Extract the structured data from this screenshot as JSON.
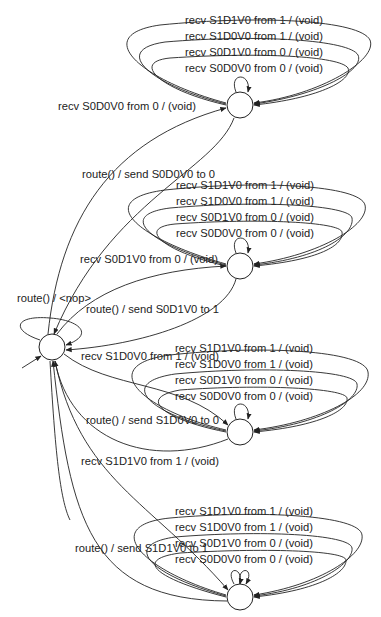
{
  "diagram": {
    "title": "",
    "nodes": [
      {
        "id": "n0",
        "label": "",
        "role": "hub-initial"
      },
      {
        "id": "n1",
        "label": ""
      },
      {
        "id": "n2",
        "label": ""
      },
      {
        "id": "n3",
        "label": ""
      },
      {
        "id": "n4",
        "label": ""
      }
    ],
    "groups": [
      {
        "state": "n1",
        "self_loops": [
          "recv S1D1V0 from 1 / (void)",
          "recv S1D0V0 from 1 / (void)",
          "recv S0D1V0 from 0 / (void)",
          "recv S0D0V0 from 0 / (void)"
        ],
        "to_hub": "route() / send S0D0V0 to 0",
        "from_hub": "recv S0D0V0 from 0 / (void)"
      },
      {
        "state": "n2",
        "self_loops": [
          "recv S1D1V0 from 1 / (void)",
          "recv S1D0V0 from 1 / (void)",
          "recv S0D1V0 from 0 / (void)",
          "recv S0D0V0 from 0 / (void)"
        ],
        "to_hub": "route() / send S0D1V0 to 1",
        "from_hub": "recv S0D1V0 from 0 / (void)"
      },
      {
        "state": "n3",
        "self_loops": [
          "recv S1D1V0 from 1 / (void)",
          "recv S1D0V0 from 1 / (void)",
          "recv S0D1V0 from 0 / (void)",
          "recv S0D0V0 from 0 / (void)"
        ],
        "to_hub": "route() / send S1D0V0 to 0",
        "from_hub": "recv S1D0V0 from 1 / (void)"
      },
      {
        "state": "n4",
        "self_loops": [
          "recv S1D1V0 from 1 / (void)",
          "recv S1D0V0 from 1 / (void)",
          "recv S0D1V0 from 0 / (void)",
          "recv S0D0V0 from 0 / (void)"
        ],
        "to_hub": "route() / send S1D1V0 to 1",
        "from_hub": "recv S1D1V0 from 1 / (void)"
      }
    ],
    "hub_self_loop": "route() / <nop>"
  }
}
